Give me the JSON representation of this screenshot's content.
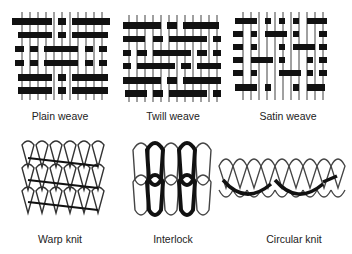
{
  "panels": [
    {
      "label": "Plain weave",
      "icon": "plain-weave-diagram"
    },
    {
      "label": "Twill weave",
      "icon": "twill-weave-diagram"
    },
    {
      "label": "Satin weave",
      "icon": "satin-weave-diagram"
    },
    {
      "label": "Warp knit",
      "icon": "warp-knit-diagram"
    },
    {
      "label": "Interlock",
      "icon": "interlock-diagram"
    },
    {
      "label": "Circular knit",
      "icon": "circular-knit-diagram"
    }
  ]
}
